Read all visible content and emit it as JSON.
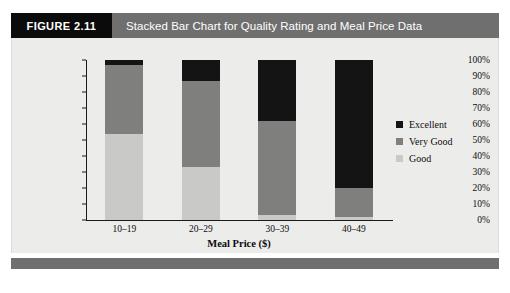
{
  "header": {
    "figure_tag": "FIGURE 2.11",
    "title": "Stacked Bar Chart for Quality Rating and Meal Price Data",
    "tag_bg": "#0b0b0b",
    "title_bg": "#6f6f6f"
  },
  "chart_data": {
    "type": "bar",
    "stacked": true,
    "title": "Stacked Bar Chart for Quality Rating and Meal Price Data",
    "xlabel": "Meal Price ($)",
    "ylabel": "",
    "categories": [
      "10–19",
      "20–29",
      "30–39",
      "40–49"
    ],
    "ylim": [
      0,
      100
    ],
    "ytick_labels": [
      "100%",
      "90%",
      "80%",
      "70%",
      "60%",
      "50%",
      "40%",
      "30%",
      "20%",
      "10%",
      "0%"
    ],
    "ytick_values": [
      100,
      90,
      80,
      70,
      60,
      50,
      40,
      30,
      20,
      10,
      0
    ],
    "grid": false,
    "legend_position": "right",
    "series": [
      {
        "name": "Excellent",
        "color": "#141414",
        "values": [
          3,
          13,
          38,
          78
        ]
      },
      {
        "name": "Very Good",
        "color": "#7f7f7e",
        "values": [
          43,
          54,
          59,
          20
        ]
      },
      {
        "name": "Good",
        "color": "#c9c9c7",
        "values": [
          54,
          33,
          3,
          2
        ]
      }
    ],
    "bars": [
      {
        "category": "10–19",
        "segments": [
          {
            "name": "Good",
            "start": 0,
            "end": 54,
            "value": 54,
            "color": "#c9c9c7"
          },
          {
            "name": "Very Good",
            "start": 54,
            "end": 97,
            "value": 43,
            "color": "#7f7f7e"
          },
          {
            "name": "Excellent",
            "start": 97,
            "end": 100,
            "value": 3,
            "color": "#141414"
          }
        ]
      },
      {
        "category": "20–29",
        "segments": [
          {
            "name": "Good",
            "start": 0,
            "end": 33,
            "value": 33,
            "color": "#c9c9c7"
          },
          {
            "name": "Very Good",
            "start": 33,
            "end": 87,
            "value": 54,
            "color": "#7f7f7e"
          },
          {
            "name": "Excellent",
            "start": 87,
            "end": 100,
            "value": 13,
            "color": "#141414"
          }
        ]
      },
      {
        "category": "30–39",
        "segments": [
          {
            "name": "Good",
            "start": 0,
            "end": 3,
            "value": 3,
            "color": "#c9c9c7"
          },
          {
            "name": "Very Good",
            "start": 3,
            "end": 62,
            "value": 59,
            "color": "#7f7f7e"
          },
          {
            "name": "Excellent",
            "start": 62,
            "end": 100,
            "value": 38,
            "color": "#141414"
          }
        ]
      },
      {
        "category": "40–49",
        "segments": [
          {
            "name": "Good",
            "start": 0,
            "end": 2,
            "value": 2,
            "color": "#c9c9c7"
          },
          {
            "name": "Very Good",
            "start": 2,
            "end": 20,
            "value": 18,
            "color": "#7f7f7e"
          },
          {
            "name": "Excellent",
            "start": 20,
            "end": 100,
            "value": 80,
            "color": "#141414"
          }
        ]
      }
    ],
    "legend": [
      {
        "label": "Excellent",
        "color": "#141414"
      },
      {
        "label": "Very Good",
        "color": "#7f7f7e"
      },
      {
        "label": "Good",
        "color": "#c9c9c7"
      }
    ]
  }
}
